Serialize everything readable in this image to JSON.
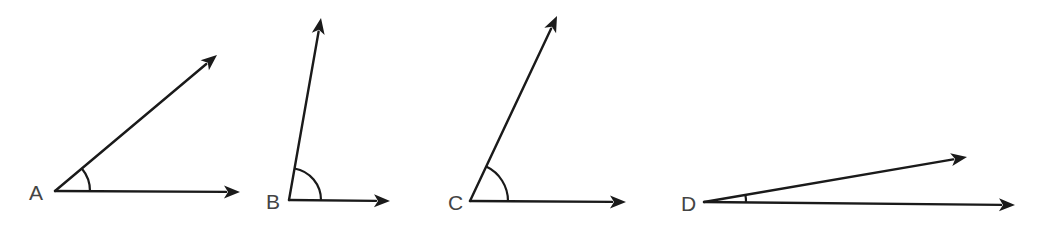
{
  "diagram": {
    "type": "angles",
    "stroke_color": "#1a1a1a",
    "label_color": "#444444",
    "angles": [
      {
        "label": "A",
        "vertex": [
          55,
          191
        ],
        "ray1_end": [
          240,
          192
        ],
        "ray2_end": [
          217,
          55
        ],
        "arc_radius": 35,
        "label_pos": [
          29,
          200
        ],
        "approx_degrees": 40
      },
      {
        "label": "B",
        "vertex": [
          289,
          200
        ],
        "ray1_end": [
          390,
          201
        ],
        "ray2_end": [
          321,
          18
        ],
        "arc_radius": 32,
        "label_pos": [
          266,
          209
        ],
        "approx_degrees": 80
      },
      {
        "label": "C",
        "vertex": [
          470,
          201
        ],
        "ray1_end": [
          626,
          202
        ],
        "ray2_end": [
          557,
          16
        ],
        "arc_radius": 38,
        "label_pos": [
          448,
          210
        ],
        "approx_degrees": 65
      },
      {
        "label": "D",
        "vertex": [
          704,
          202
        ],
        "ray1_end": [
          1015,
          205
        ],
        "ray2_end": [
          967,
          157
        ],
        "arc_radius": 42,
        "label_pos": [
          681,
          211
        ],
        "approx_degrees": 10
      }
    ]
  }
}
